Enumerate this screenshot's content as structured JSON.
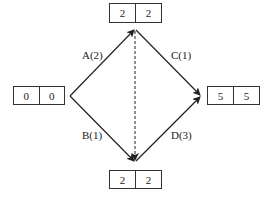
{
  "diagram": {
    "type": "activity-on-arrow network",
    "nodes": [
      {
        "id": "start",
        "earliest": "0",
        "latest": "0"
      },
      {
        "id": "top",
        "earliest": "2",
        "latest": "2"
      },
      {
        "id": "bottom",
        "earliest": "2",
        "latest": "2"
      },
      {
        "id": "end",
        "earliest": "5",
        "latest": "5"
      }
    ],
    "activities": [
      {
        "label": "A(2)",
        "from": "start",
        "to": "top"
      },
      {
        "label": "B(1)",
        "from": "start",
        "to": "bottom"
      },
      {
        "label": "C(1)",
        "from": "top",
        "to": "end"
      },
      {
        "label": "D(3)",
        "from": "bottom",
        "to": "end"
      }
    ],
    "dummy": {
      "from": "top",
      "to": "bottom",
      "style": "dashed"
    }
  }
}
